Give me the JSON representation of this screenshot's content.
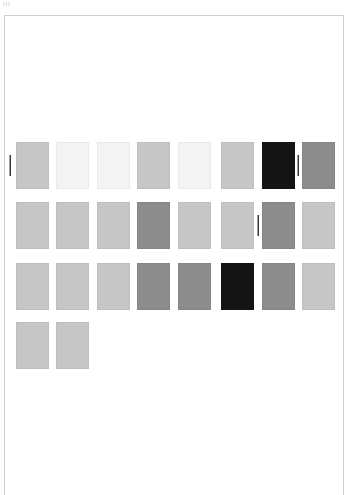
{
  "header": {
    "label": "ııı"
  },
  "palette": {
    "rows": [
      {
        "top": 142,
        "swatches": [
          {
            "color": "#c6c6c6"
          },
          {
            "color": "#f3f3f3"
          },
          {
            "color": "#f3f3f3"
          },
          {
            "color": "#c6c6c6"
          },
          {
            "color": "#f3f3f3"
          },
          {
            "color": "#c6c6c6"
          },
          {
            "color": "#141414"
          },
          {
            "color": "#8c8c8c"
          }
        ]
      },
      {
        "top": 202,
        "swatches": [
          {
            "color": "#c6c6c6"
          },
          {
            "color": "#c6c6c6"
          },
          {
            "color": "#c6c6c6"
          },
          {
            "color": "#8c8c8c"
          },
          {
            "color": "#c6c6c6"
          },
          {
            "color": "#c6c6c6"
          },
          {
            "color": "#8c8c8c"
          },
          {
            "color": "#c6c6c6"
          }
        ]
      },
      {
        "top": 263,
        "swatches": [
          {
            "color": "#c6c6c6"
          },
          {
            "color": "#c6c6c6"
          },
          {
            "color": "#c6c6c6"
          },
          {
            "color": "#8c8c8c"
          },
          {
            "color": "#8c8c8c"
          },
          {
            "color": "#141414"
          },
          {
            "color": "#8c8c8c"
          },
          {
            "color": "#c6c6c6"
          }
        ]
      },
      {
        "top": 322,
        "swatches": [
          {
            "color": "#c6c6c6"
          },
          {
            "color": "#c6c6c6"
          }
        ]
      }
    ],
    "column_lefts": [
      16,
      56,
      97,
      137,
      178,
      221,
      262,
      302
    ],
    "carets": [
      {
        "left": 9,
        "top": 155
      },
      {
        "left": 297,
        "top": 155
      },
      {
        "left": 257,
        "top": 215
      }
    ]
  },
  "colors": {
    "border": "#cfcfcf",
    "light": "#f3f3f3",
    "mid": "#c6c6c6",
    "dark": "#8c8c8c",
    "black": "#141414"
  }
}
